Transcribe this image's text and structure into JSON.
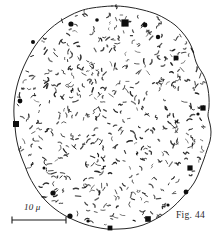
{
  "figure": {
    "caption": "Fig. 44",
    "scale_bar": {
      "label": "10 μ",
      "value": 10,
      "unit": "μ",
      "bar_x_start": 12,
      "bar_x_end": 66,
      "bar_y": 220
    },
    "background_color": "#ffffff",
    "ink_color": "#1a1a1a",
    "outline_color": "#262626"
  },
  "chart_data": {
    "type": "scatter",
    "title": "Fig. 44",
    "xlabel": "",
    "ylabel": "",
    "xlim": [
      0,
      223
    ],
    "ylim": [
      0,
      239
    ],
    "grid": false,
    "legend": null,
    "annotations": [
      "10 μ",
      "Fig. 44"
    ],
    "cell_outline": {
      "name": "cell-membrane",
      "closed": true,
      "stroke": "#262626",
      "stroke_width": 1,
      "fill": "none",
      "points": [
        [
          112,
          6
        ],
        [
          128,
          7
        ],
        [
          143,
          10
        ],
        [
          156,
          14
        ],
        [
          166,
          19
        ],
        [
          175,
          25
        ],
        [
          182,
          32
        ],
        [
          188,
          40
        ],
        [
          192,
          48
        ],
        [
          194,
          55
        ],
        [
          196,
          62
        ],
        [
          199,
          68
        ],
        [
          203,
          74
        ],
        [
          206,
          81
        ],
        [
          208,
          89
        ],
        [
          209,
          98
        ],
        [
          209,
          107
        ],
        [
          208,
          116
        ],
        [
          210,
          124
        ],
        [
          211,
          132
        ],
        [
          210,
          141
        ],
        [
          207,
          150
        ],
        [
          204,
          159
        ],
        [
          201,
          167
        ],
        [
          198,
          175
        ],
        [
          194,
          183
        ],
        [
          188,
          191
        ],
        [
          181,
          199
        ],
        [
          173,
          207
        ],
        [
          164,
          214
        ],
        [
          154,
          220
        ],
        [
          143,
          225
        ],
        [
          131,
          228
        ],
        [
          119,
          229
        ],
        [
          107,
          229
        ],
        [
          95,
          227
        ],
        [
          84,
          224
        ],
        [
          74,
          220
        ],
        [
          64,
          215
        ],
        [
          55,
          209
        ],
        [
          47,
          202
        ],
        [
          40,
          194
        ],
        [
          34,
          185
        ],
        [
          29,
          176
        ],
        [
          25,
          166
        ],
        [
          21,
          156
        ],
        [
          18,
          146
        ],
        [
          16,
          136
        ],
        [
          15,
          126
        ],
        [
          14,
          116
        ],
        [
          14,
          106
        ],
        [
          15,
          96
        ],
        [
          17,
          86
        ],
        [
          20,
          76
        ],
        [
          24,
          66
        ],
        [
          29,
          56
        ],
        [
          35,
          46
        ],
        [
          42,
          37
        ],
        [
          50,
          29
        ],
        [
          59,
          22
        ],
        [
          69,
          16
        ],
        [
          80,
          11
        ],
        [
          92,
          8
        ],
        [
          112,
          6
        ]
      ]
    },
    "granules": [
      {
        "x": 71,
        "y": 24,
        "r": 2.6,
        "shape": "circle"
      },
      {
        "x": 97,
        "y": 20,
        "r": 1.8,
        "shape": "circle"
      },
      {
        "x": 125,
        "y": 23,
        "r": 3.6,
        "shape": "square"
      },
      {
        "x": 145,
        "y": 25,
        "r": 2.4,
        "shape": "circle"
      },
      {
        "x": 158,
        "y": 37,
        "r": 2.2,
        "shape": "circle"
      },
      {
        "x": 176,
        "y": 58,
        "r": 2.4,
        "shape": "square"
      },
      {
        "x": 33,
        "y": 42,
        "r": 2.0,
        "shape": "circle"
      },
      {
        "x": 203,
        "y": 108,
        "r": 2.6,
        "shape": "square"
      },
      {
        "x": 198,
        "y": 114,
        "r": 1.6,
        "shape": "circle"
      },
      {
        "x": 20,
        "y": 101,
        "r": 2.4,
        "shape": "circle"
      },
      {
        "x": 16,
        "y": 124,
        "r": 3.0,
        "shape": "square"
      },
      {
        "x": 190,
        "y": 168,
        "r": 2.6,
        "shape": "square"
      },
      {
        "x": 53,
        "y": 193,
        "r": 2.6,
        "shape": "circle"
      },
      {
        "x": 186,
        "y": 192,
        "r": 2.4,
        "shape": "circle"
      },
      {
        "x": 70,
        "y": 216,
        "r": 2.6,
        "shape": "circle"
      },
      {
        "x": 148,
        "y": 219,
        "r": 2.8,
        "shape": "square"
      },
      {
        "x": 110,
        "y": 228,
        "r": 2.4,
        "shape": "square"
      },
      {
        "x": 88,
        "y": 221,
        "r": 1.6,
        "shape": "circle"
      },
      {
        "x": 168,
        "y": 205,
        "r": 1.6,
        "shape": "circle"
      },
      {
        "x": 44,
        "y": 168,
        "r": 1.5,
        "shape": "circle"
      }
    ],
    "bacteria_count": 520,
    "bacteria_note": "short comma / rod / vibrio-shaped marks scattered densely inside the cell"
  }
}
